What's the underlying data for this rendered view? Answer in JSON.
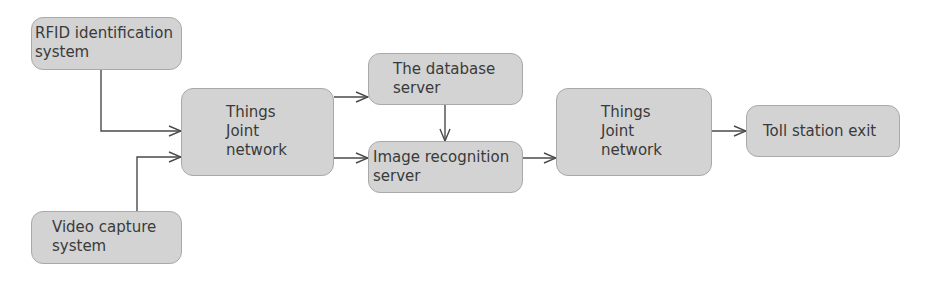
{
  "diagram": {
    "type": "flowchart",
    "colors": {
      "node_fill": "#d3d3d3",
      "node_border": "#a9a9a9",
      "text": "#3a3a3a",
      "edge": "#4a4a4a"
    },
    "nodes": {
      "rfid": {
        "label": "RFID identification\nsystem"
      },
      "video": {
        "label": "Video capture\nsystem"
      },
      "iot1": {
        "label": "Things\nJoint\nnetwork"
      },
      "database": {
        "label": "The database\nserver"
      },
      "image_recognition": {
        "label": "Image recognition\nserver"
      },
      "iot2": {
        "label": "Things\nJoint\nnetwork"
      },
      "toll_exit": {
        "label": "Toll station exit"
      }
    },
    "edges": [
      {
        "from": "rfid",
        "to": "iot1"
      },
      {
        "from": "video",
        "to": "iot1"
      },
      {
        "from": "iot1",
        "to": "database"
      },
      {
        "from": "iot1",
        "to": "image_recognition"
      },
      {
        "from": "database",
        "to": "image_recognition"
      },
      {
        "from": "image_recognition",
        "to": "iot2"
      },
      {
        "from": "iot2",
        "to": "toll_exit"
      }
    ]
  }
}
